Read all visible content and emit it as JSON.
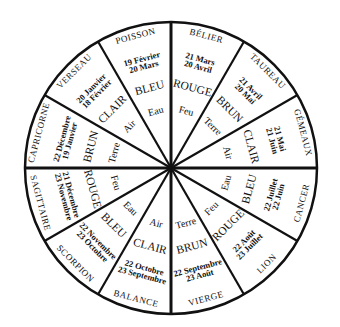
{
  "wheel": {
    "center": [
      171,
      168
    ],
    "radius": 146,
    "line_color": "#111111",
    "background": "#ffffff"
  },
  "signs": [
    {
      "name": "BÉLIER",
      "date_start": "21 Mars",
      "date_end": "20 Avril",
      "color": "ROUGE",
      "element": "Feu"
    },
    {
      "name": "TAUREAU",
      "date_start": "21 Avril",
      "date_end": "20 Mai",
      "color": "BRUN",
      "element": "Terre"
    },
    {
      "name": "GÉMEAUX",
      "date_start": "21 Mai",
      "date_end": "21 Juin",
      "color": "CLAIR",
      "element": "Air"
    },
    {
      "name": "CANCER",
      "date_start": "22 Juin",
      "date_end": "22 Juillet",
      "color": "BLEU",
      "element": "Eau"
    },
    {
      "name": "LION",
      "date_start": "23 Juillet",
      "date_end": "22 Août",
      "color": "ROUGE",
      "element": "Feu"
    },
    {
      "name": "VIERGE",
      "date_start": "23 Août",
      "date_end": "22 Septembre",
      "color": "BRUN",
      "element": "Terre"
    },
    {
      "name": "BALANCE",
      "date_start": "23 Septembre",
      "date_end": "22 Octobre",
      "color": "CLAIR",
      "element": "Air"
    },
    {
      "name": "SCORPION",
      "date_start": "23 Octobre",
      "date_end": "22 Novembre",
      "color": "BLEU",
      "element": "Eau"
    },
    {
      "name": "SAGITTAIRE",
      "date_start": "23 Novembre",
      "date_end": "21 Décembre",
      "color": "ROUGE",
      "element": "Feu"
    },
    {
      "name": "CAPRICORNE",
      "date_start": "22 Décembre",
      "date_end": "19 Janvier",
      "color": "BRUN",
      "element": "Terre"
    },
    {
      "name": "VERSEAU",
      "date_start": "20 Janvier",
      "date_end": "18 Février",
      "color": "CLAIR",
      "element": "Air"
    },
    {
      "name": "POISSON",
      "date_start": "19 Février",
      "date_end": "20 Mars",
      "color": "BLEU",
      "element": "Eau"
    }
  ]
}
